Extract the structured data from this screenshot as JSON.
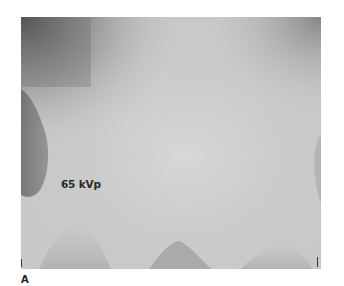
{
  "figure": {
    "panel_label": "A",
    "annotation": "65 kVp",
    "image_description": "Grayscale radiograph with soft-tissue exposure gradient; darker regions at upper-left corner and left edge, lighter center, faint darker triangular shapes along bottom edge",
    "colors": {
      "center_gray": "#c9c9c9",
      "dark_corner": "#5e5e5e",
      "light_gray": "#d8d8d8",
      "text": "#2a2a2a"
    }
  }
}
